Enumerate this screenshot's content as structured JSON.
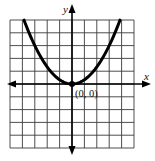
{
  "chart_data": {
    "type": "line",
    "title": "",
    "xlabel": "x",
    "ylabel": "y",
    "xlim": [
      -5,
      5
    ],
    "ylim": [
      -5,
      5
    ],
    "grid": true,
    "grid_step": 1,
    "series": [
      {
        "name": "parabola",
        "equation": "y = x^2 / 3",
        "x": [
          -3.87,
          -3,
          -2,
          -1,
          0,
          1,
          2,
          3,
          3.87
        ],
        "y": [
          5,
          3,
          1.33,
          0.33,
          0,
          0.33,
          1.33,
          3,
          5
        ]
      }
    ],
    "annotations": [
      {
        "text": "(0, 0)",
        "x": 0,
        "y": 0,
        "marker": "point"
      }
    ]
  },
  "labels": {
    "x_axis": "x",
    "y_axis": "y",
    "vertex": "(0, 0)"
  },
  "colors": {
    "curve": "#000000",
    "grid": "#3a3a3a",
    "axis": "#000000",
    "background": "#ffffff"
  }
}
